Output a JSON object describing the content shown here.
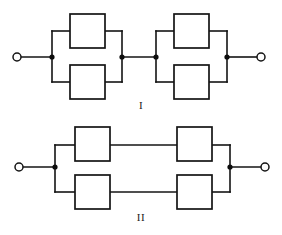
{
  "figure": {
    "title": "",
    "background_color": "#ffffff",
    "line_color": "#141414",
    "width": 282,
    "height": 235
  },
  "diagrams": [
    {
      "id": "diagram-I",
      "label": "I",
      "description": "Two series-connected parallel pairs of components",
      "terminals": [
        {
          "name": "left-terminal",
          "cx": 17,
          "cy": 57,
          "r": 4
        },
        {
          "name": "right-terminal",
          "cx": 261,
          "cy": 57,
          "r": 4
        }
      ],
      "nodes": [
        {
          "name": "node-a",
          "cx": 52,
          "cy": 57,
          "r": 2.6
        },
        {
          "name": "node-b",
          "cx": 122,
          "cy": 57,
          "r": 2.6
        },
        {
          "name": "node-c",
          "cx": 156,
          "cy": 57,
          "r": 2.6
        },
        {
          "name": "node-d",
          "cx": 227,
          "cy": 57,
          "r": 2.6
        }
      ],
      "boxes": [
        {
          "name": "box-1",
          "x": 70,
          "y": 14,
          "w": 35,
          "h": 34
        },
        {
          "name": "box-2",
          "x": 70,
          "y": 65,
          "w": 35,
          "h": 34
        },
        {
          "name": "box-3",
          "x": 174,
          "y": 14,
          "w": 35,
          "h": 34
        },
        {
          "name": "box-4",
          "x": 174,
          "y": 65,
          "w": 35,
          "h": 34
        }
      ],
      "wires": [
        {
          "name": "lead-left",
          "d": "M 21 57 L 52 57"
        },
        {
          "name": "group1-left-rail",
          "d": "M 52 31 L 52 82"
        },
        {
          "name": "group1-top-in",
          "d": "M 52 31 L 70 31"
        },
        {
          "name": "group1-top-out",
          "d": "M 105 31 L 122 31"
        },
        {
          "name": "group1-bottom-in",
          "d": "M 52 82 L 70 82"
        },
        {
          "name": "group1-bottom-out",
          "d": "M 105 82 L 122 82"
        },
        {
          "name": "group1-right-rail",
          "d": "M 122 31 L 122 82"
        },
        {
          "name": "series-link",
          "d": "M 122 57 L 156 57"
        },
        {
          "name": "group2-left-rail",
          "d": "M 156 31 L 156 82"
        },
        {
          "name": "group2-top-in",
          "d": "M 156 31 L 174 31"
        },
        {
          "name": "group2-top-out",
          "d": "M 209 31 L 227 31"
        },
        {
          "name": "group2-bottom-in",
          "d": "M 156 82 L 174 82"
        },
        {
          "name": "group2-bottom-out",
          "d": "M 209 82 L 227 82"
        },
        {
          "name": "group2-right-rail",
          "d": "M 227 31 L 227 82"
        },
        {
          "name": "lead-right",
          "d": "M 227 57 L 257 57"
        }
      ]
    },
    {
      "id": "diagram-II",
      "label": "II",
      "description": "Two parallel branches, each with two series components",
      "terminals": [
        {
          "name": "left-terminal",
          "cx": 19,
          "cy": 167,
          "r": 4
        },
        {
          "name": "right-terminal",
          "cx": 265,
          "cy": 167,
          "r": 4
        }
      ],
      "nodes": [
        {
          "name": "node-left",
          "cx": 55,
          "cy": 167,
          "r": 2.6
        },
        {
          "name": "node-right",
          "cx": 230,
          "cy": 167,
          "r": 2.6
        }
      ],
      "boxes": [
        {
          "name": "box-1",
          "x": 75,
          "y": 127,
          "w": 35,
          "h": 34
        },
        {
          "name": "box-2",
          "x": 177,
          "y": 127,
          "w": 35,
          "h": 34
        },
        {
          "name": "box-3",
          "x": 75,
          "y": 175,
          "w": 35,
          "h": 34
        },
        {
          "name": "box-4",
          "x": 177,
          "y": 175,
          "w": 35,
          "h": 34
        }
      ],
      "wires": [
        {
          "name": "lead-left",
          "d": "M 23 167 L 55 167"
        },
        {
          "name": "left-rail",
          "d": "M 55 145 L 55 192"
        },
        {
          "name": "top-branch-in",
          "d": "M 55 145 L 75 145"
        },
        {
          "name": "top-branch-mid",
          "d": "M 110 145 L 177 145"
        },
        {
          "name": "top-branch-out",
          "d": "M 212 145 L 230 145"
        },
        {
          "name": "bottom-branch-in",
          "d": "M 55 192 L 75 192"
        },
        {
          "name": "bottom-branch-mid",
          "d": "M 110 192 L 177 192"
        },
        {
          "name": "bottom-branch-out",
          "d": "M 212 192 L 230 192"
        },
        {
          "name": "right-rail",
          "d": "M 230 145 L 230 192"
        },
        {
          "name": "lead-right",
          "d": "M 230 167 L 261 167"
        }
      ]
    }
  ]
}
